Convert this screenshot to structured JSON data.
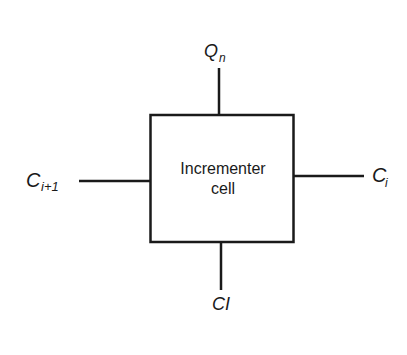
{
  "diagram": {
    "type": "block-diagram",
    "block": {
      "label_line1": "Incrementer",
      "label_line2": "cell"
    },
    "ports": {
      "top": {
        "main": "Q",
        "sub": "n"
      },
      "left": {
        "main": "C",
        "sub": "i+1"
      },
      "right": {
        "main": "C",
        "sub": "i"
      },
      "bottom": {
        "main": "CI",
        "sub": ""
      }
    },
    "colors": {
      "stroke": "#1a1a1a",
      "background": "#ffffff"
    }
  }
}
